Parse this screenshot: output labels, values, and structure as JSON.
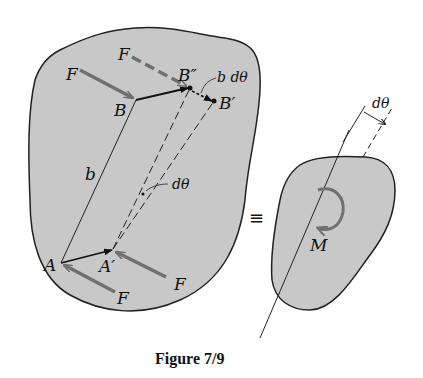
{
  "figure": {
    "caption": "Figure 7/9",
    "colors": {
      "body_fill": "#c8c8c8",
      "outline": "#222222",
      "force_arrow": "#707070",
      "background": "#ffffff"
    }
  },
  "left_body": {
    "labels": {
      "force_top_dashed": "F",
      "force_top_solid": "F",
      "point_B": "B",
      "point_B_double_prime": "B″",
      "point_B_prime": "B′",
      "displacement": "b dθ",
      "length": "b",
      "rotation_angle": "dθ",
      "point_A": "A",
      "point_A_prime": "A′",
      "force_bottom_left": "F",
      "force_bottom_right": "F"
    }
  },
  "equivalence": {
    "symbol": "≡"
  },
  "right_body": {
    "labels": {
      "moment": "M",
      "rotation_angle": "dθ"
    }
  }
}
